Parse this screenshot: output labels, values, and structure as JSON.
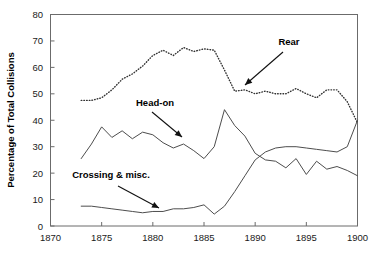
{
  "chart_data": {
    "type": "line",
    "title": "",
    "xlabel": "",
    "ylabel": "Percentage of Total Collisions",
    "xlim": [
      1870,
      1900
    ],
    "ylim": [
      0,
      80
    ],
    "xticks": [
      1870,
      1875,
      1880,
      1885,
      1890,
      1895,
      1900
    ],
    "yticks": [
      0,
      10,
      20,
      30,
      40,
      50,
      60,
      70,
      80
    ],
    "grid": false,
    "legend_position": "inline-annotations",
    "series": [
      {
        "name": "Rear",
        "style": "dotted",
        "x": [
          1873,
          1874,
          1875,
          1876,
          1877,
          1878,
          1879,
          1880,
          1881,
          1882,
          1883,
          1884,
          1885,
          1886,
          1887,
          1888,
          1889,
          1890,
          1891,
          1892,
          1893,
          1894,
          1895,
          1896,
          1897,
          1898,
          1899,
          1900
        ],
        "values": [
          47.5,
          47.5,
          48.5,
          51.5,
          55.5,
          57.5,
          60.5,
          64.5,
          66.5,
          64.5,
          67.5,
          66.0,
          67.0,
          66.5,
          59.0,
          51.0,
          51.5,
          50.0,
          51.0,
          50.0,
          50.0,
          52.0,
          50.0,
          48.5,
          51.5,
          51.5,
          47.0,
          39.0
        ]
      },
      {
        "name": "Head-on",
        "style": "solid",
        "x": [
          1873,
          1874,
          1875,
          1876,
          1877,
          1878,
          1879,
          1880,
          1881,
          1882,
          1883,
          1884,
          1885,
          1886,
          1887,
          1888,
          1889,
          1890,
          1891,
          1892,
          1893,
          1894,
          1895,
          1896,
          1897,
          1898,
          1899,
          1900
        ],
        "values": [
          25.5,
          31.0,
          37.5,
          33.5,
          36.0,
          33.0,
          35.5,
          34.5,
          31.5,
          29.5,
          31.0,
          28.5,
          25.5,
          30.0,
          44.0,
          38.0,
          34.0,
          27.5,
          25.0,
          24.5,
          22.0,
          25.5,
          19.5,
          24.5,
          21.5,
          22.5,
          21.0,
          19.0
        ]
      },
      {
        "name": "Crossing & misc.",
        "style": "solid",
        "x": [
          1873,
          1874,
          1875,
          1876,
          1877,
          1878,
          1879,
          1880,
          1881,
          1882,
          1883,
          1884,
          1885,
          1886,
          1887,
          1888,
          1889,
          1890,
          1891,
          1892,
          1893,
          1894,
          1895,
          1896,
          1897,
          1898,
          1899,
          1900
        ],
        "values": [
          7.5,
          7.5,
          7.0,
          6.5,
          6.0,
          5.5,
          5.0,
          5.5,
          5.5,
          6.5,
          6.5,
          7.0,
          8.0,
          4.5,
          7.5,
          13.0,
          19.0,
          25.0,
          28.0,
          29.5,
          30.0,
          30.0,
          29.5,
          29.0,
          28.5,
          28.0,
          30.0,
          40.0
        ]
      }
    ],
    "annotations": [
      {
        "label": "Rear",
        "text_x": 289,
        "text_y": 45,
        "arrow_from_x": 283,
        "arrow_from_y": 52,
        "arrow_to_x": 245,
        "arrow_to_y": 85
      },
      {
        "label": "Head-on",
        "text_x": 155,
        "text_y": 106,
        "arrow_from_x": 152,
        "arrow_from_y": 112,
        "arrow_to_x": 182,
        "arrow_to_y": 137
      },
      {
        "label": "Crossing & misc.",
        "text_x": 111,
        "text_y": 178,
        "arrow_from_x": 118,
        "arrow_from_y": 186,
        "arrow_to_x": 159,
        "arrow_to_y": 208
      }
    ]
  }
}
